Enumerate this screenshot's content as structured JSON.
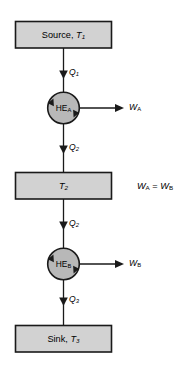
{
  "diagram": {
    "colors": {
      "box_fill": "#d2d2d2",
      "circle_fill": "#b8b8b8",
      "stroke": "#1a1a1a",
      "background": "#ffffff"
    },
    "nodes": [
      {
        "id": "source",
        "kind": "box",
        "label_main": "Source, ",
        "label_var": "T",
        "label_sub": "1",
        "full_text": "Source, T1"
      },
      {
        "id": "he-a",
        "kind": "circle",
        "label_main": "HE",
        "label_sub": "A",
        "full_text": "HEA"
      },
      {
        "id": "reservoir-t2",
        "kind": "box",
        "label_main": "",
        "label_var": "T",
        "label_sub": "2",
        "full_text": "T2"
      },
      {
        "id": "he-b",
        "kind": "circle",
        "label_main": "HE",
        "label_sub": "B",
        "full_text": "HEB"
      },
      {
        "id": "sink",
        "kind": "box",
        "label_main": "Sink, ",
        "label_var": "T",
        "label_sub": "3",
        "full_text": "Sink, T3"
      }
    ],
    "heat_flows": [
      {
        "id": "q1",
        "var": "Q",
        "sub": "1",
        "full_text": "Q1",
        "from": "source",
        "to": "he-a"
      },
      {
        "id": "q2-upper",
        "var": "Q",
        "sub": "2",
        "full_text": "Q2",
        "from": "he-a",
        "to": "reservoir-t2"
      },
      {
        "id": "q2-lower",
        "var": "Q",
        "sub": "2",
        "full_text": "Q2",
        "from": "reservoir-t2",
        "to": "he-b"
      },
      {
        "id": "q3",
        "var": "Q",
        "sub": "3",
        "full_text": "Q3",
        "from": "he-b",
        "to": "sink"
      }
    ],
    "work_flows": [
      {
        "id": "wa",
        "var": "W",
        "sub": "A",
        "full_text": "WA",
        "from": "he-a"
      },
      {
        "id": "wb",
        "var": "W",
        "sub": "B",
        "full_text": "WB",
        "from": "he-b"
      }
    ],
    "relation": {
      "id": "work-equality",
      "left_var": "W",
      "left_sub": "A",
      "operator": " = ",
      "right_var": "W",
      "right_sub": "B",
      "full_text": "WA = WB"
    }
  }
}
